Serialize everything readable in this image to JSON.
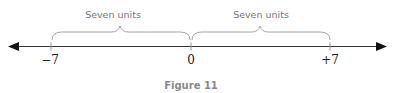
{
  "figure": {
    "caption": "Figure 11",
    "type": "number-line",
    "ticks": [
      {
        "value": -7,
        "label": "−7"
      },
      {
        "value": 0,
        "label": "0"
      },
      {
        "value": 7,
        "label": "+7"
      }
    ],
    "braces": [
      {
        "from": -7,
        "to": 0,
        "label": "Seven units"
      },
      {
        "from": 0,
        "to": 7,
        "label": "Seven units"
      }
    ],
    "arrows": [
      "left",
      "right"
    ],
    "colors": {
      "axis": "#333333",
      "arrowhead": "#111111",
      "brace": "#9a9a9a",
      "brace_label": "#777777",
      "tick_label": "#222222",
      "caption": "#8a8a8a"
    }
  }
}
